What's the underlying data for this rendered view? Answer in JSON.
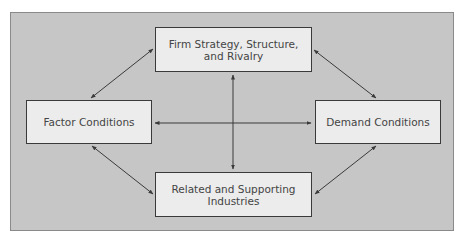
{
  "diagram": {
    "type": "porter-diamond",
    "colors": {
      "panel_background": "#c6c6c6",
      "panel_border": "#8a8a8a",
      "node_fill": "#ececec",
      "node_border": "#3a3a3a",
      "text": "#444444",
      "arrow": "#3a3a3a"
    },
    "nodes": {
      "top": {
        "label": "Firm Strategy, Structure,\nand Rivalry"
      },
      "left": {
        "label": "Factor Conditions"
      },
      "right": {
        "label": "Demand Conditions"
      },
      "bottom": {
        "label": "Related and Supporting\nIndustries"
      }
    },
    "edges": [
      {
        "from": "left",
        "to": "top",
        "direction": "bidirectional"
      },
      {
        "from": "top",
        "to": "right",
        "direction": "bidirectional"
      },
      {
        "from": "left",
        "to": "bottom",
        "direction": "bidirectional"
      },
      {
        "from": "right",
        "to": "bottom",
        "direction": "bidirectional"
      },
      {
        "from": "left",
        "to": "right",
        "direction": "bidirectional"
      },
      {
        "from": "top",
        "to": "bottom",
        "direction": "bidirectional"
      }
    ]
  }
}
